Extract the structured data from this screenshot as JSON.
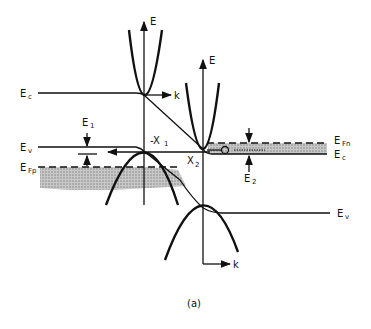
{
  "diagram": {
    "caption": "(a)",
    "left_region": {
      "conduction_band_label": "E",
      "conduction_band_sub": "c",
      "valence_band_label": "E",
      "valence_band_sub": "v",
      "fermi_level_label": "E",
      "fermi_level_sub": "Fp",
      "axis_energy": "E",
      "axis_k": "k",
      "gap_label": "E",
      "gap_sub": "1",
      "valley_label": "-X",
      "valley_sub": "1"
    },
    "right_region": {
      "conduction_band_label": "E",
      "conduction_band_sub": "c",
      "valence_band_label": "E",
      "valence_band_sub": "v",
      "fermi_level_label": "E",
      "fermi_level_sub": "Fn",
      "axis_energy": "E",
      "axis_k": "k",
      "gap_label": "E",
      "gap_sub": "2",
      "valley_label": "X",
      "valley_sub": "2",
      "carrier_symbol": "e"
    },
    "colors": {
      "ink": "#111111",
      "shade": "#b8b8b8",
      "background": "#ffffff"
    }
  }
}
